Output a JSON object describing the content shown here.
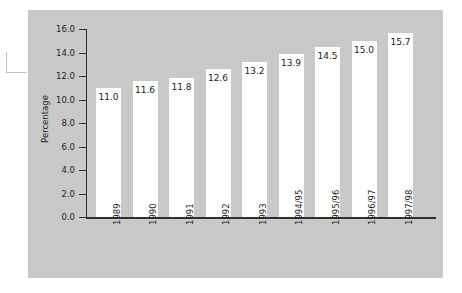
{
  "chart_data": {
    "type": "bar",
    "title": "",
    "xlabel": "",
    "ylabel": "Percentage",
    "ylim": [
      0.0,
      16.0
    ],
    "ytick_labels": [
      "0.0",
      "2.0",
      "4.0",
      "6.0",
      "8.0",
      "10.0",
      "12.0",
      "14.0",
      "16.0"
    ],
    "ytick_values": [
      0.0,
      2.0,
      4.0,
      6.0,
      8.0,
      10.0,
      12.0,
      14.0,
      16.0
    ],
    "grid": false,
    "legend": null,
    "categories": [
      "1989",
      "1990",
      "1991",
      "1992",
      "1993",
      "1994/95",
      "1995/96",
      "1996/97",
      "1997/98"
    ],
    "values": [
      11.0,
      11.6,
      11.8,
      12.6,
      13.2,
      13.9,
      14.5,
      15.0,
      15.7
    ],
    "data_labels": [
      "11.0",
      "11.6",
      "11.8",
      "12.6",
      "13.2",
      "13.9",
      "14.5",
      "15.0",
      "15.7"
    ],
    "bar_color": "#ffffff",
    "panel_color": "#c9c9c9",
    "axis_color": "#303030",
    "text_color": "#242424"
  }
}
